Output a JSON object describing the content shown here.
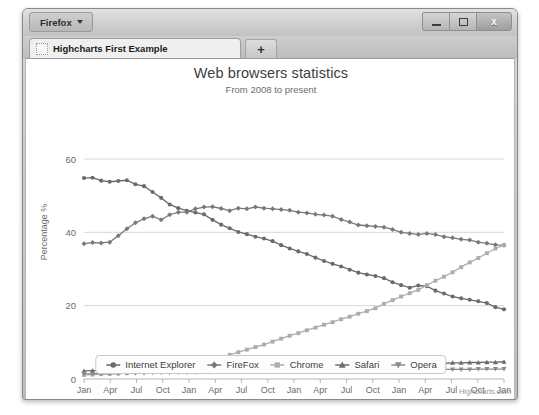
{
  "window": {
    "app_menu_label": "Firefox",
    "minimize_label": "minimize",
    "maximize_label": "maximize",
    "close_label": "x",
    "tab_title": "Highcharts First Example",
    "new_tab_label": "+"
  },
  "chart": {
    "title": "Web browsers statistics",
    "subtitle": "From 2008 to present",
    "credits": "Highcharts.com"
  },
  "chart_data": {
    "type": "line",
    "title": "Web browsers statistics",
    "subtitle": "From 2008 to present",
    "xlabel": "",
    "ylabel": "Percentage %",
    "ylim": [
      0,
      60
    ],
    "yticks": [
      0,
      20,
      40,
      60
    ],
    "grid": true,
    "legend_position": "bottom",
    "x_tick_labels": [
      "Jan",
      "Apr",
      "Jul",
      "Oct",
      "Jan",
      "Apr",
      "Jul",
      "Oct",
      "Jan",
      "Apr",
      "Jul",
      "Oct",
      "Jan",
      "Apr",
      "Jul",
      "Oct",
      "Jan"
    ],
    "x_year_labels": [
      "2008",
      "2009",
      "2010",
      "2011",
      "2012"
    ],
    "x_year_positions": [
      0,
      4,
      8,
      12,
      16
    ],
    "series": [
      {
        "name": "Internet Explorer",
        "marker": "circle",
        "color": "#6b6b6b",
        "values": [
          54.8,
          54.9,
          54.1,
          53.8,
          54.0,
          54.2,
          53.1,
          52.6,
          51.0,
          49.4,
          47.6,
          46.6,
          45.9,
          45.4,
          44.9,
          43.4,
          42.1,
          41.1,
          40.1,
          39.5,
          38.8,
          38.3,
          37.6,
          36.5,
          35.6,
          34.8,
          34.1,
          33.1,
          32.2,
          31.4,
          30.7,
          29.8,
          29.0,
          28.5,
          28.1,
          27.5,
          26.4,
          25.6,
          24.9,
          25.5,
          25.3,
          24.1,
          23.3,
          22.5,
          22.0,
          21.6,
          21.2,
          20.7,
          19.6,
          19.0
        ]
      },
      {
        "name": "FireFox",
        "marker": "diamond",
        "color": "#787878",
        "values": [
          36.9,
          37.2,
          37.1,
          37.3,
          39.1,
          41.0,
          42.6,
          43.7,
          44.4,
          43.4,
          44.8,
          45.5,
          45.5,
          46.4,
          46.9,
          47.0,
          46.5,
          45.9,
          46.6,
          46.4,
          46.9,
          46.6,
          46.4,
          46.2,
          46.0,
          45.5,
          45.3,
          44.9,
          44.7,
          44.4,
          43.5,
          42.8,
          42.0,
          41.8,
          41.6,
          41.4,
          40.8,
          40.0,
          39.7,
          39.4,
          39.7,
          39.4,
          38.8,
          38.5,
          38.1,
          37.9,
          37.3,
          37.0,
          36.6,
          36.5
        ]
      },
      {
        "name": "Chrome",
        "marker": "square",
        "color": "#adadad",
        "values": [
          1.1,
          1.2,
          1.3,
          1.4,
          1.5,
          1.6,
          1.8,
          2.0,
          2.3,
          2.6,
          3.0,
          3.3,
          3.7,
          4.1,
          4.6,
          5.2,
          5.9,
          6.6,
          7.3,
          8.0,
          8.7,
          9.4,
          10.2,
          11.0,
          11.8,
          12.5,
          13.3,
          14.0,
          14.8,
          15.5,
          16.3,
          17.0,
          17.8,
          18.5,
          19.3,
          20.5,
          21.5,
          22.5,
          23.4,
          24.3,
          25.6,
          26.8,
          27.9,
          29.1,
          30.5,
          31.8,
          33.0,
          34.3,
          35.6,
          36.5
        ]
      },
      {
        "name": "Safari",
        "marker": "triangle",
        "color": "#6b6b6b",
        "values": [
          2.2,
          2.3,
          2.3,
          2.4,
          2.4,
          2.5,
          2.5,
          2.6,
          2.6,
          2.7,
          2.7,
          2.8,
          2.8,
          2.9,
          2.9,
          3.0,
          3.0,
          3.1,
          3.1,
          3.2,
          3.2,
          3.3,
          3.3,
          3.4,
          3.4,
          3.5,
          3.5,
          3.6,
          3.6,
          3.7,
          3.7,
          3.8,
          3.8,
          3.9,
          3.9,
          4.0,
          4.0,
          4.1,
          4.1,
          4.2,
          4.2,
          4.3,
          4.3,
          4.4,
          4.4,
          4.5,
          4.5,
          4.6,
          4.6,
          4.7
        ]
      },
      {
        "name": "Opera",
        "marker": "triangle-down",
        "color": "#8a8a8a",
        "values": [
          1.4,
          1.4,
          1.5,
          1.5,
          1.5,
          1.6,
          1.6,
          1.6,
          1.7,
          1.7,
          1.7,
          1.8,
          1.8,
          1.8,
          1.9,
          1.9,
          1.9,
          2.0,
          2.0,
          2.0,
          2.0,
          2.1,
          2.1,
          2.1,
          2.1,
          2.2,
          2.2,
          2.2,
          2.2,
          2.3,
          2.3,
          2.3,
          2.3,
          2.4,
          2.4,
          2.4,
          2.4,
          2.5,
          2.5,
          2.5,
          2.5,
          2.5,
          2.6,
          2.6,
          2.6,
          2.6,
          2.7,
          2.7,
          2.7,
          2.7
        ]
      }
    ]
  },
  "legend": {
    "items": [
      {
        "label": "Internet Explorer",
        "marker": "circle"
      },
      {
        "label": "FireFox",
        "marker": "diamond"
      },
      {
        "label": "Chrome",
        "marker": "square"
      },
      {
        "label": "Safari",
        "marker": "triangle"
      },
      {
        "label": "Opera",
        "marker": "triangle-down"
      }
    ]
  }
}
